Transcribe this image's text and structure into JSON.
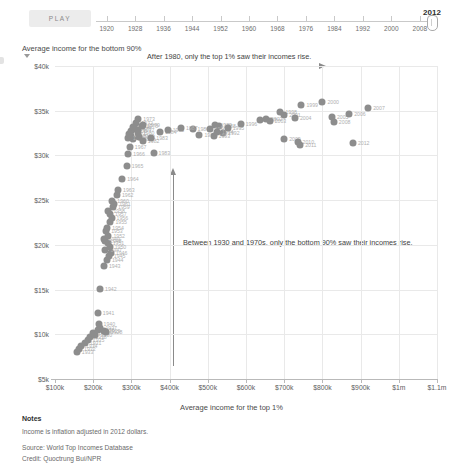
{
  "controls": {
    "play_label": "PLAY",
    "current_year": "2012",
    "tick_years": [
      "1920",
      "1928",
      "1936",
      "1944",
      "1952",
      "1960",
      "1968",
      "1976",
      "1984",
      "1992",
      "2000",
      "2008"
    ],
    "slider_min": 1917,
    "slider_max": 2012
  },
  "annotations": {
    "top": "After 1980, only the top 1% saw their incomes rise.",
    "middle": "Between 1930 and 1970s, only the bottom 90% saw their incomes rise."
  },
  "footer": {
    "heading": "Notes",
    "note": "Income is inflation adjusted in 2012 dollars.",
    "source": "Source: World Top Incomes Database",
    "credit": "Credit: Quoctrung Bui/NPR"
  },
  "colors": {
    "dot": "#8d8d8d",
    "dot_label": "#b0b0b0",
    "grid": "#e9e9e9",
    "axis": "#b9b9b9",
    "play_button_bg": "#ececec",
    "text": "#4a4a4a"
  },
  "chart_data": {
    "type": "scatter",
    "title": "",
    "xlabel": "Average income for the top 1%",
    "ylabel": "Average income for the bottom 90%",
    "xlim": [
      100000,
      1100000
    ],
    "ylim": [
      5000,
      40000
    ],
    "xticks": [
      100000,
      200000,
      300000,
      400000,
      500000,
      600000,
      700000,
      800000,
      900000,
      1000000,
      1100000
    ],
    "xticklabels": [
      "$100k",
      "$200k",
      "$300k",
      "$400k",
      "$500k",
      "$600k",
      "$700k",
      "$800k",
      "$900k",
      "$1m",
      "$1.1m"
    ],
    "yticks": [
      5000,
      10000,
      15000,
      20000,
      25000,
      30000,
      35000,
      40000
    ],
    "yticklabels": [
      "$5k",
      "$10k",
      "$15k",
      "$20k",
      "$25k",
      "$30k",
      "$35k",
      "$40k"
    ],
    "grid": true,
    "legend": false,
    "point_label_key": "year",
    "points": [
      {
        "year": "1933",
        "x": 157000,
        "y": 8000
      },
      {
        "year": "1932",
        "x": 163000,
        "y": 8300
      },
      {
        "year": "1934",
        "x": 168000,
        "y": 8700
      },
      {
        "year": "1931",
        "x": 178000,
        "y": 9000
      },
      {
        "year": "1935",
        "x": 186000,
        "y": 9400
      },
      {
        "year": "1938",
        "x": 192000,
        "y": 9700
      },
      {
        "year": "1939",
        "x": 200000,
        "y": 10100
      },
      {
        "year": "1930",
        "x": 206000,
        "y": 9900
      },
      {
        "year": "1936",
        "x": 213000,
        "y": 10500
      },
      {
        "year": "1937",
        "x": 219000,
        "y": 10700
      },
      {
        "year": "1929",
        "x": 228000,
        "y": 10400
      },
      {
        "year": "1928",
        "x": 233000,
        "y": 10200
      },
      {
        "year": "1940",
        "x": 214000,
        "y": 11200
      },
      {
        "year": "1941",
        "x": 212000,
        "y": 12400
      },
      {
        "year": "1942",
        "x": 218000,
        "y": 15100
      },
      {
        "year": "1943",
        "x": 228000,
        "y": 17600
      },
      {
        "year": "1944",
        "x": 236000,
        "y": 18300
      },
      {
        "year": "1945",
        "x": 241000,
        "y": 18700
      },
      {
        "year": "1946",
        "x": 246000,
        "y": 19100
      },
      {
        "year": "1947",
        "x": 232000,
        "y": 19400
      },
      {
        "year": "1950",
        "x": 243000,
        "y": 19800
      },
      {
        "year": "1951",
        "x": 238000,
        "y": 20200
      },
      {
        "year": "1948",
        "x": 231000,
        "y": 20400
      },
      {
        "year": "1949",
        "x": 227000,
        "y": 20700
      },
      {
        "year": "1952",
        "x": 240000,
        "y": 21000
      },
      {
        "year": "1953",
        "x": 234000,
        "y": 21500
      },
      {
        "year": "1954",
        "x": 237000,
        "y": 21900
      },
      {
        "year": "1955",
        "x": 245000,
        "y": 22600
      },
      {
        "year": "1956",
        "x": 248000,
        "y": 23000
      },
      {
        "year": "1957",
        "x": 244000,
        "y": 23400
      },
      {
        "year": "1958",
        "x": 240000,
        "y": 23800
      },
      {
        "year": "1959",
        "x": 252000,
        "y": 24200
      },
      {
        "year": "1961",
        "x": 255000,
        "y": 24600
      },
      {
        "year": "1960",
        "x": 250000,
        "y": 24900
      },
      {
        "year": "1962",
        "x": 262000,
        "y": 25600
      },
      {
        "year": "1963",
        "x": 265000,
        "y": 26100
      },
      {
        "year": "1964",
        "x": 276000,
        "y": 27400
      },
      {
        "year": "1965",
        "x": 288000,
        "y": 28800
      },
      {
        "year": "1966",
        "x": 292000,
        "y": 30200
      },
      {
        "year": "1967",
        "x": 296000,
        "y": 30900
      },
      {
        "year": "1968",
        "x": 304000,
        "y": 31800
      },
      {
        "year": "1969",
        "x": 300000,
        "y": 32200
      },
      {
        "year": "1970",
        "x": 291000,
        "y": 32000
      },
      {
        "year": "1971",
        "x": 295000,
        "y": 32400
      },
      {
        "year": "1972",
        "x": 313000,
        "y": 33600
      },
      {
        "year": "1973",
        "x": 318000,
        "y": 34100
      },
      {
        "year": "1974",
        "x": 303000,
        "y": 33200
      },
      {
        "year": "1975",
        "x": 298000,
        "y": 32700
      },
      {
        "year": "1976",
        "x": 309000,
        "y": 33000
      },
      {
        "year": "1977",
        "x": 317000,
        "y": 32800
      },
      {
        "year": "1978",
        "x": 327000,
        "y": 33300
      },
      {
        "year": "1979",
        "x": 331000,
        "y": 33400
      },
      {
        "year": "1980",
        "x": 317000,
        "y": 32500
      },
      {
        "year": "1981",
        "x": 320000,
        "y": 32100
      },
      {
        "year": "1982",
        "x": 330000,
        "y": 31600
      },
      {
        "year": "1983",
        "x": 352000,
        "y": 31900
      },
      {
        "year": "1984",
        "x": 375000,
        "y": 32600
      },
      {
        "year": "1985",
        "x": 395000,
        "y": 32800
      },
      {
        "year": "1986",
        "x": 460000,
        "y": 33000
      },
      {
        "year": "1987",
        "x": 430000,
        "y": 33100
      },
      {
        "year": "1988",
        "x": 530000,
        "y": 33300
      },
      {
        "year": "1989",
        "x": 520000,
        "y": 33400
      },
      {
        "year": "1990",
        "x": 505000,
        "y": 32900
      },
      {
        "year": "1991",
        "x": 478000,
        "y": 32300
      },
      {
        "year": "1992",
        "x": 540000,
        "y": 32500
      },
      {
        "year": "1993",
        "x": 515000,
        "y": 32200
      },
      {
        "year": "1994",
        "x": 524000,
        "y": 32600
      },
      {
        "year": "1995",
        "x": 552000,
        "y": 33100
      },
      {
        "year": "1996",
        "x": 586000,
        "y": 33500
      },
      {
        "year": "1997",
        "x": 637000,
        "y": 34000
      },
      {
        "year": "1998",
        "x": 690000,
        "y": 34900
      },
      {
        "year": "1999",
        "x": 745000,
        "y": 35600
      },
      {
        "year": "2000",
        "x": 800000,
        "y": 36000
      },
      {
        "year": "2001",
        "x": 700000,
        "y": 34500
      },
      {
        "year": "2002",
        "x": 652000,
        "y": 34100
      },
      {
        "year": "2003",
        "x": 662000,
        "y": 33800
      },
      {
        "year": "2004",
        "x": 728000,
        "y": 34200
      },
      {
        "year": "2005",
        "x": 825000,
        "y": 34300
      },
      {
        "year": "2006",
        "x": 870000,
        "y": 34600
      },
      {
        "year": "2007",
        "x": 920000,
        "y": 35300
      },
      {
        "year": "2008",
        "x": 830000,
        "y": 33700
      },
      {
        "year": "2009",
        "x": 700000,
        "y": 31800
      },
      {
        "year": "2010",
        "x": 735000,
        "y": 31500
      },
      {
        "year": "2011",
        "x": 742000,
        "y": 31200
      },
      {
        "year": "2012",
        "x": 880000,
        "y": 31400
      },
      {
        "year": "1983b",
        "x": 358000,
        "y": 30300
      }
    ]
  }
}
